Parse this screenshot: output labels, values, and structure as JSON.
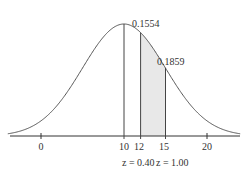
{
  "chart_data": {
    "type": "area",
    "title": "",
    "xlabel": "",
    "ylabel": "",
    "mean": 10,
    "std_dev": 5,
    "x_ticks": [
      0,
      10,
      12,
      15,
      20
    ],
    "x_tick_labels": [
      "0",
      "10",
      "12",
      "15",
      "20"
    ],
    "shaded_region": {
      "from": 12,
      "to": 15
    },
    "annotations": [
      {
        "text": "0.1554",
        "target": "area between 10 and 12"
      },
      {
        "text": "0.1859",
        "target": "shaded area between 12 and 15"
      },
      {
        "text": "z = 0.40",
        "at_x": 12
      },
      {
        "text": "z = 1.00",
        "at_x": 15
      }
    ],
    "grid": false,
    "colors": {
      "curve": "#555555",
      "shade": "#e6e6e6",
      "axis": "#333333"
    }
  },
  "labels": {
    "area1": "0.1554",
    "area2": "0.1859",
    "tick0": "0",
    "tick10": "10",
    "tick12": "12",
    "tick15": "15",
    "tick20": "20",
    "z1": "z = 0.40",
    "z2": "z = 1.00"
  }
}
